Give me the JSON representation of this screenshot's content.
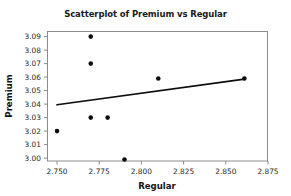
{
  "chart_data": {
    "type": "scatter",
    "title": "Scatterplot of Premium vs Regular",
    "xlabel": "Regular",
    "ylabel": "Premium",
    "xlim": [
      2.75,
      2.875
    ],
    "ylim": [
      2.995,
      3.0945
    ],
    "grid": false,
    "legend": "none",
    "xticks": [
      2.75,
      2.775,
      2.8,
      2.825,
      2.85,
      2.875
    ],
    "xtick_labels": [
      "2.750",
      "2.775",
      "2.800",
      "2.825",
      "2.850",
      "2.875"
    ],
    "yticks": [
      3.0,
      3.01,
      3.02,
      3.03,
      3.04,
      3.05,
      3.06,
      3.07,
      3.08,
      3.09
    ],
    "ytick_labels": [
      "3.00",
      "3.01",
      "3.02",
      "3.03",
      "3.04",
      "3.05",
      "3.06",
      "3.07",
      "3.08",
      "3.09"
    ],
    "points": [
      {
        "x": 2.75,
        "y": 3.02
      },
      {
        "x": 2.77,
        "y": 3.09
      },
      {
        "x": 2.77,
        "y": 3.07
      },
      {
        "x": 2.77,
        "y": 3.03
      },
      {
        "x": 2.78,
        "y": 3.03
      },
      {
        "x": 2.79,
        "y": 2.999
      },
      {
        "x": 2.81,
        "y": 3.059
      },
      {
        "x": 2.861,
        "y": 3.059
      }
    ],
    "marker": {
      "shape": "circle",
      "size": 4.6,
      "color": "#0d0d0d"
    },
    "trend_line": {
      "x1": 2.75,
      "y1": 3.0395,
      "x2": 2.861,
      "y2": 3.0585,
      "color": "#0d0d0d",
      "width": 1.7
    },
    "colors": {
      "marker": "#0d0d0d",
      "trend": "#0d0d0d",
      "frame": "#8c8c8c",
      "text": "#1a1a1a",
      "background": "#ffffff"
    }
  }
}
